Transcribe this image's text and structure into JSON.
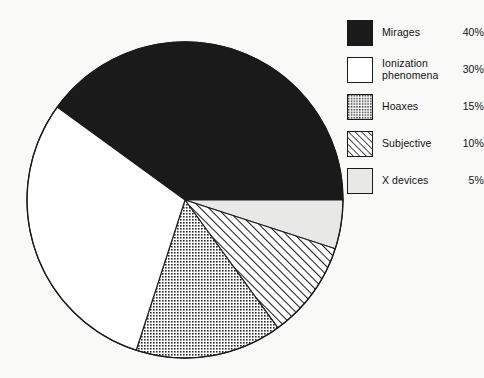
{
  "chart_data": {
    "type": "pie",
    "title": "",
    "subtitle": "",
    "xlabel": "",
    "ylabel": "",
    "grid": false,
    "legend_position": "right",
    "units": "percent",
    "total": 100,
    "start_angle_deg": -144,
    "direction": "clockwise",
    "categories": [
      "Mirages",
      "Ionization phenomena",
      "Hoaxes",
      "Subjective",
      "X devices"
    ],
    "values": [
      40,
      30,
      15,
      10,
      5
    ],
    "labels": [
      "40%",
      "30%",
      "15%",
      "10%",
      "5%"
    ],
    "slices": [
      {
        "label": "Mirages",
        "value": 40,
        "value_label": "40%",
        "angle_deg": 144,
        "start_deg": -144,
        "end_deg": 0,
        "fill": "solid-black",
        "color": "#1a1a1a"
      },
      {
        "label": "X devices",
        "value": 5,
        "value_label": "5%",
        "angle_deg": 18,
        "start_deg": 0,
        "end_deg": 18,
        "fill": "light-gray",
        "color": "#e8e8e6"
      },
      {
        "label": "Subjective",
        "value": 10,
        "value_label": "10%",
        "angle_deg": 36,
        "start_deg": 18,
        "end_deg": 54,
        "fill": "diagonal-hatch",
        "color": "#ffffff"
      },
      {
        "label": "Hoaxes",
        "value": 15,
        "value_label": "15%",
        "angle_deg": 54,
        "start_deg": 54,
        "end_deg": 108,
        "fill": "checkered-gray",
        "color": "#a8a8a8"
      },
      {
        "label": "Ionization phenomena",
        "value": 30,
        "value_label": "30%",
        "angle_deg": 108,
        "start_deg": 108,
        "end_deg": 216,
        "fill": "white",
        "color": "#ffffff"
      }
    ]
  },
  "legend": {
    "items": [
      {
        "label": "Mirages",
        "value": "40%",
        "swatch": "solid-black-swatch"
      },
      {
        "label": "Ionization\nphenomena",
        "value": "30%",
        "swatch": "white-swatch"
      },
      {
        "label": "Hoaxes",
        "value": "15%",
        "swatch": "checkered-gray-swatch"
      },
      {
        "label": "Subjective",
        "value": "10%",
        "swatch": "diagonal-hatch-swatch"
      },
      {
        "label": "X devices",
        "value": "5%",
        "swatch": "light-gray-swatch"
      }
    ]
  },
  "style": {
    "background": "#f9f9f8",
    "outline": "#1a1a1a",
    "black": "#1a1a1a",
    "gray": "#a8a8a8",
    "light_gray": "#e8e8e6",
    "white": "#ffffff"
  },
  "geometry": {
    "center_x": 185,
    "center_y": 200,
    "radius": 158
  }
}
